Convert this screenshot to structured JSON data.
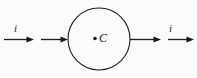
{
  "figure": {
    "background_color": "#fbfbfb",
    "stroke_color": "#1a1a1a",
    "width": 197,
    "height": 78
  },
  "labels": {
    "current_left": "i",
    "current_right": "i",
    "center_point": "C"
  },
  "geometry": {
    "circle": {
      "cx": 99,
      "cy": 39,
      "r": 31,
      "stroke_width": 1.1,
      "fill": "none"
    },
    "center_dot": {
      "cx": 95,
      "cy": 38.5,
      "r": 1.8
    },
    "arrows": [
      {
        "name": "left-outer-arrow",
        "x1": 4,
        "y1": 39.5,
        "x2": 34,
        "y2": 39.5
      },
      {
        "name": "left-inner-arrow",
        "x1": 41,
        "y1": 39.5,
        "x2": 68,
        "y2": 39.5
      },
      {
        "name": "right-inner-arrow",
        "x1": 130,
        "y1": 39.5,
        "x2": 161,
        "y2": 39.5
      },
      {
        "name": "right-outer-arrow",
        "x1": 168,
        "y1": 39.5,
        "x2": 194,
        "y2": 39.5
      }
    ],
    "arrow_head": {
      "length": 7,
      "half_width": 2.8
    },
    "line_width": 1.3
  }
}
